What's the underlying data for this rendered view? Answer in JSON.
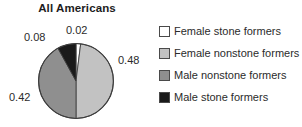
{
  "chart_data": {
    "type": "pie",
    "title": "All Americans",
    "categories": [
      "Female stone formers",
      "Female nonstone formers",
      "Male nonstone formers",
      "Male stone formers"
    ],
    "values": [
      0.02,
      0.48,
      0.42,
      0.08
    ],
    "data_labels": [
      "0.02",
      "0.48",
      "0.42",
      "0.08"
    ],
    "colors": [
      "#ffffff",
      "#c2c2c2",
      "#8f8f8f",
      "#1a1a1a"
    ],
    "start_angle_deg": 0,
    "direction": "clockwise",
    "legend_position": "right",
    "grid": false,
    "xlabel": "",
    "ylabel": ""
  },
  "legend": {
    "items": [
      {
        "label": "Female stone formers",
        "swatch": "#ffffff"
      },
      {
        "label": "Female nonstone formers",
        "swatch": "#c2c2c2"
      },
      {
        "label": "Male nonstone formers",
        "swatch": "#8f8f8f"
      },
      {
        "label": "Male stone formers",
        "swatch": "#1a1a1a"
      }
    ]
  }
}
